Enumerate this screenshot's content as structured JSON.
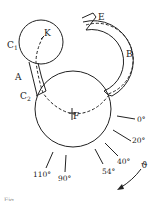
{
  "diagram": {
    "labels": {
      "C1": "C",
      "C1_sub": "1",
      "K": "K",
      "A": "A",
      "C2": "C",
      "C2_sub": "2",
      "E": "E",
      "B": "B",
      "F": "F",
      "theta": "ϑ"
    },
    "angles": [
      {
        "label": "0°"
      },
      {
        "label": "20°"
      },
      {
        "label": "40°"
      },
      {
        "label": "54°"
      },
      {
        "label": "90°"
      },
      {
        "label": "110°"
      }
    ],
    "caption": "Fig. ..."
  }
}
